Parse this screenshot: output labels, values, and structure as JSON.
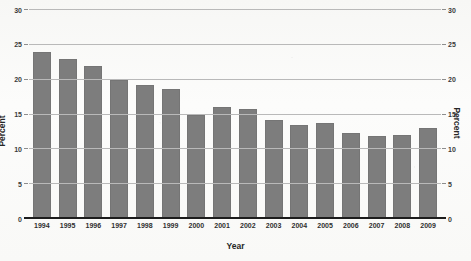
{
  "chart_data": {
    "type": "bar",
    "title": "",
    "xlabel": "Year",
    "ylabel": "Percent",
    "ylabel_right": "Percent",
    "categories": [
      "1994",
      "1995",
      "1996",
      "1997",
      "1998",
      "1999",
      "2000",
      "2001",
      "2002",
      "2003",
      "2004",
      "2005",
      "2006",
      "2007",
      "2008",
      "2009"
    ],
    "values": [
      24.0,
      23.0,
      22.0,
      20.0,
      19.3,
      18.6,
      15.0,
      16.1,
      15.8,
      14.2,
      13.5,
      13.8,
      12.4,
      11.9,
      12.0,
      13.0
    ],
    "ylim": [
      0,
      30
    ],
    "yticks": [
      0,
      5,
      10,
      15,
      20,
      25,
      30
    ],
    "ytick_labels": [
      "0",
      "5",
      "10",
      "15",
      "20",
      "25",
      "30"
    ],
    "grid": true,
    "legend": "none",
    "bar_color": "#7d7d7d",
    "gridline_color": "#b9b9b9",
    "axis_color": "#1c1c1c"
  },
  "figure": {
    "clipped_title": "",
    "background": "#fbfbfa"
  }
}
